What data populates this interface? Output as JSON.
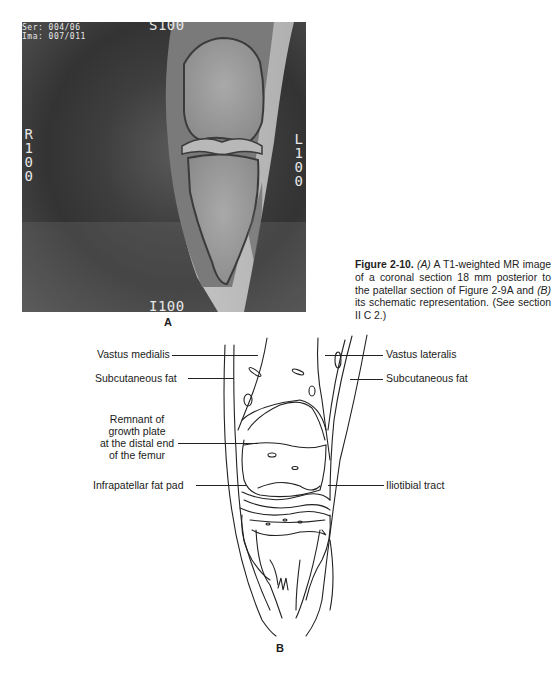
{
  "figure": {
    "number": "Figure 2-10.",
    "caption_parts": {
      "a_marker": "(A)",
      "a_text": " A T1-weighted MR image of a coronal section 18 mm posterior to the patellar section of Figure 2-9A and ",
      "b_marker": "(B)",
      "b_text": " its schematic representation. (See section II C 2.)"
    }
  },
  "panel_a": {
    "label": "A",
    "overlay": {
      "series": "Ser: 004/06",
      "image": "Ima: 007/011",
      "top": "S100",
      "bottom": "I100",
      "left": "R\n1\n0\n0",
      "right": "L\n1\n0\n0"
    }
  },
  "panel_b": {
    "label": "B",
    "labels_left": [
      {
        "text": "Vastus medialis"
      },
      {
        "text": "Subcutaneous fat"
      },
      {
        "text": "Remnant of growth plate\nat the distal end\nof the femur"
      },
      {
        "text": "Infrapatellar fat pad"
      }
    ],
    "labels_right": [
      {
        "text": "Vastus lateralis"
      },
      {
        "text": "Subcutaneous fat"
      },
      {
        "text": "Iliotibial tract"
      }
    ]
  }
}
